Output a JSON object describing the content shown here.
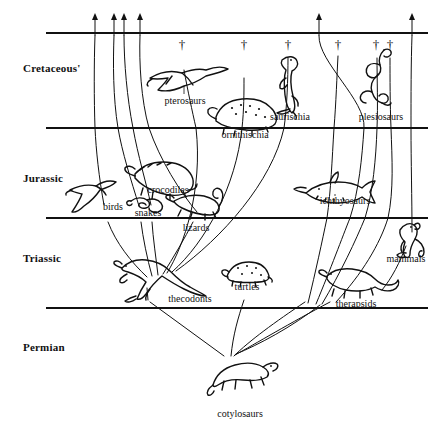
{
  "figure": {
    "kind": "phylogenetic-tree",
    "background_color": "#ffffff",
    "ink_color": "#111111"
  },
  "eras": [
    {
      "name": "Cretaceous'",
      "label_x": 23,
      "label_y": 62
    },
    {
      "name": "Jurassic",
      "label_x": 23,
      "label_y": 172
    },
    {
      "name": "Triassic",
      "label_x": 23,
      "label_y": 252
    },
    {
      "name": "Permian",
      "label_x": 23,
      "label_y": 341
    }
  ],
  "boundaries": [
    {
      "name": "top-boundary",
      "y": 33,
      "x1": 46,
      "x2": 428
    },
    {
      "name": "cretaceous-jurassic-boundary",
      "y": 128,
      "x1": 46,
      "x2": 428
    },
    {
      "name": "jurassic-triassic-boundary",
      "y": 218,
      "x1": 46,
      "x2": 428
    },
    {
      "name": "triassic-permian-boundary",
      "y": 308,
      "x1": 46,
      "x2": 428
    }
  ],
  "taxa": [
    {
      "id": "pterosaurs",
      "label": "pterosaurs",
      "label_x": 185,
      "label_y": 101,
      "extinct": true,
      "icon": "pterosaur-icon"
    },
    {
      "id": "ornithischia",
      "label": "ornithischia",
      "label_x": 245,
      "label_y": 135,
      "extinct": true,
      "icon": "ornithischian-icon"
    },
    {
      "id": "saurischia",
      "label": "saurischia",
      "label_x": 290,
      "label_y": 117,
      "extinct": true,
      "icon": "saurischian-icon"
    },
    {
      "id": "plesiosaurs",
      "label": "plesiosaurs",
      "label_x": 381,
      "label_y": 117,
      "extinct": true,
      "icon": "plesiosaur-icon"
    },
    {
      "id": "birds",
      "label": "birds",
      "label_x": 113,
      "label_y": 207,
      "extinct": false,
      "icon": "bird-icon"
    },
    {
      "id": "crocodiles",
      "label": "crocodiles",
      "label_x": 168,
      "label_y": 190,
      "extinct": false,
      "icon": "crocodile-icon"
    },
    {
      "id": "snakes",
      "label": "snakes",
      "label_x": 148,
      "label_y": 213,
      "extinct": false,
      "icon": "snake-icon"
    },
    {
      "id": "lizards",
      "label": "lizards",
      "label_x": 196,
      "label_y": 228,
      "extinct": false,
      "icon": "lizard-icon"
    },
    {
      "id": "ichthyosaurs",
      "label": "ichthyosaurs",
      "label_x": 345,
      "label_y": 201,
      "extinct": true,
      "icon": "ichthyosaur-icon"
    },
    {
      "id": "mammals",
      "label": "mammals",
      "label_x": 406,
      "label_y": 259,
      "extinct": false,
      "icon": "mammal-icon"
    },
    {
      "id": "thecodonts",
      "label": "thecodonts",
      "label_x": 190,
      "label_y": 299,
      "extinct": true,
      "icon": "thecodont-icon"
    },
    {
      "id": "turtles",
      "label": "turtles",
      "label_x": 247,
      "label_y": 287,
      "extinct": false,
      "icon": "turtle-icon"
    },
    {
      "id": "therapsids",
      "label": "therapsids",
      "label_x": 356,
      "label_y": 304,
      "extinct": true,
      "icon": "therapsid-icon"
    },
    {
      "id": "cotylosaurs",
      "label": "cotylosaurs",
      "label_x": 240,
      "label_y": 414,
      "extinct": false,
      "icon": "cotylosaur-icon"
    }
  ],
  "terminators": {
    "survives_glyph": "arrow-up",
    "extinct_glyph": "†",
    "survivors_x": [
      95,
      114,
      124,
      140,
      319,
      412
    ],
    "extinct_x": [
      182,
      244,
      288,
      338,
      376,
      390
    ],
    "extinct_y": 44
  },
  "root": {
    "id": "cotylosaurs",
    "x": 228,
    "y": 357
  }
}
